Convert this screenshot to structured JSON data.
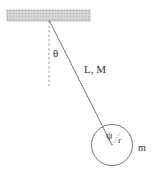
{
  "diagram": {
    "type": "pendulum",
    "labels": {
      "angle": "θ",
      "rod": "L, M",
      "disc_angle": "ψ",
      "radius": "r",
      "mass": "m"
    },
    "colors": {
      "line": "#666666",
      "ceiling_fill": "#d0d0d0",
      "ceiling_stroke": "#999999",
      "text": "#333333"
    }
  }
}
